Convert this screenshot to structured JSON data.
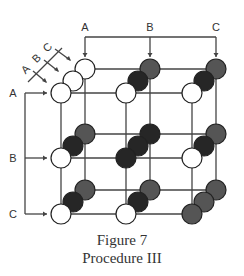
{
  "figure": {
    "caption_line1": "Figure 7",
    "caption_line2": "Procedure III"
  },
  "labels": {
    "top": [
      "A",
      "B",
      "C"
    ],
    "left": [
      "A",
      "B",
      "C"
    ],
    "depth": [
      "A",
      "B",
      "C"
    ]
  },
  "lattice": {
    "description": "3x3x3 cubic lattice of spheres; front layer shown with depth layers offset up-right",
    "colors": {
      "white": "#ffffff",
      "black": "#262626",
      "gray": "#555555",
      "line": "#444444"
    },
    "legend_note": "front(depth A) / middle(depth B) / back(depth C) sphere shading per column and row",
    "cells": [
      {
        "row": "A",
        "col": "A",
        "front": "white",
        "middle": "white",
        "back": "white"
      },
      {
        "row": "A",
        "col": "B",
        "front": "white",
        "middle": "black",
        "back": "gray"
      },
      {
        "row": "A",
        "col": "C",
        "front": "white",
        "middle": "black",
        "back": "gray"
      },
      {
        "row": "B",
        "col": "A",
        "front": "white",
        "middle": "black",
        "back": "gray"
      },
      {
        "row": "B",
        "col": "B",
        "front": "black",
        "middle": "black",
        "back": "black"
      },
      {
        "row": "B",
        "col": "C",
        "front": "white",
        "middle": "black",
        "back": "gray"
      },
      {
        "row": "C",
        "col": "A",
        "front": "white",
        "middle": "black",
        "back": "gray"
      },
      {
        "row": "C",
        "col": "B",
        "front": "white",
        "middle": "black",
        "back": "gray"
      },
      {
        "row": "C",
        "col": "C",
        "front": "gray",
        "middle": "gray",
        "back": "gray"
      }
    ]
  }
}
